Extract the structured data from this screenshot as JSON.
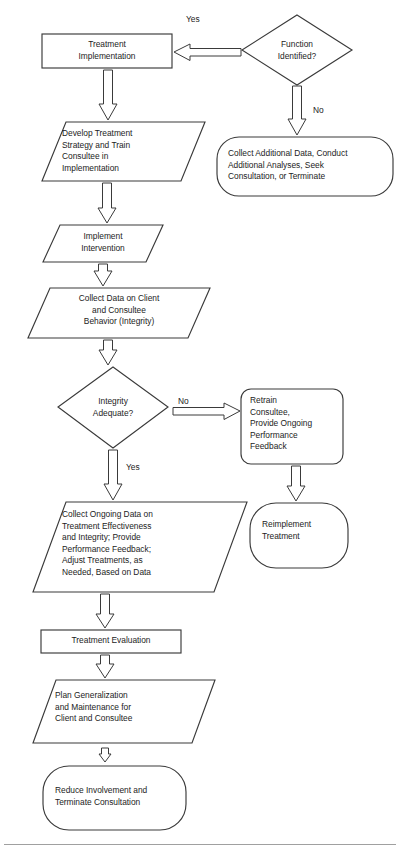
{
  "diagram": {
    "stroke_color": "#3a3a3a",
    "fill_color": "#ffffff",
    "text_color": "#1c1c1c",
    "footer_rule_color": "#9a9a9a"
  },
  "nodes": {
    "function_identified": {
      "label": "Function\nIdentified?",
      "shape": "decision-diamond"
    },
    "treatment_implementation": {
      "label": "Treatment\nImplementation",
      "shape": "process-rectangle"
    },
    "collect_additional_data": {
      "label": "Collect Additional Data, Conduct\nAdditional Analyses, Seek\nConsultation, or Terminate",
      "shape": "terminator-rounded"
    },
    "develop_treatment_strategy": {
      "label": "Develop Treatment\nStrategy and Train\nConsultee in\nImplementation",
      "shape": "data-parallelogram"
    },
    "implement_intervention": {
      "label": "Implement\nIntervention",
      "shape": "data-parallelogram"
    },
    "collect_data_on_client": {
      "label": "Collect Data on Client\nand Consultee\nBehavior (Integrity)",
      "shape": "data-parallelogram"
    },
    "integrity_adequate": {
      "label": "Integrity\nAdequate?",
      "shape": "decision-diamond"
    },
    "retrain_consultee": {
      "label": "Retrain\nConsultee,\nProvide Ongoing\nPerformance\nFeedback",
      "shape": "terminator-rounded"
    },
    "reimplement_treatment": {
      "label": "Reimplement\nTreatment",
      "shape": "terminator-rounded"
    },
    "collect_ongoing_data": {
      "label": "Collect Ongoing Data on\nTreatment Effectiveness\nand Integrity; Provide\nPerformance Feedback;\nAdjust Treatments, as\nNeeded, Based on Data",
      "shape": "data-parallelogram"
    },
    "treatment_evaluation": {
      "label": "Treatment Evaluation",
      "shape": "process-rectangle"
    },
    "plan_generalization": {
      "label": "Plan Generalization\nand Maintenance for\nClient and Consultee",
      "shape": "data-parallelogram"
    },
    "reduce_involvement": {
      "label": "Reduce Involvement and\nTerminate Consultation",
      "shape": "terminator-rounded"
    }
  },
  "edge_labels": {
    "yes_function": "Yes",
    "no_function": "No",
    "no_integrity": "No",
    "yes_integrity": "Yes"
  }
}
